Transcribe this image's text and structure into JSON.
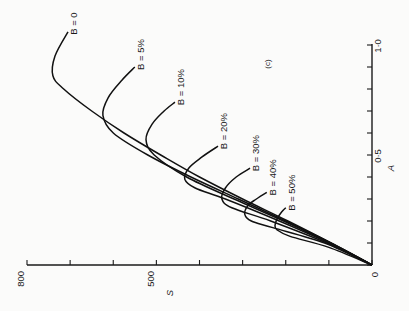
{
  "chart_data": {
    "type": "line",
    "title": "",
    "panel_label": "(c)",
    "orientation": "rotated 90° counter-clockwise (S axis runs horizontally along bottom, decreasing to the right; A axis vertical on right)",
    "xlabel": "A",
    "ylabel": "S",
    "xlim": [
      0,
      1.0
    ],
    "ylim": [
      0,
      800
    ],
    "x_ticks": [
      0,
      0.1,
      0.2,
      0.3,
      0.4,
      0.5,
      0.6,
      0.7,
      0.8,
      0.9,
      1.0
    ],
    "x_tick_labels": [
      "0",
      "",
      "",
      "",
      "",
      "0·5",
      "",
      "",
      "",
      "",
      "1·0"
    ],
    "y_ticks": [
      0,
      100,
      200,
      300,
      400,
      500,
      600,
      700,
      800
    ],
    "y_tick_labels": [
      "",
      "",
      "",
      "",
      "",
      "500",
      "",
      "",
      "800"
    ],
    "origin_label": "0",
    "grid": false,
    "legend": "inline labels at curve ends",
    "series": [
      {
        "name": "B = 0",
        "label": "B = 0",
        "points": [
          [
            0,
            0
          ],
          [
            0.1,
            95
          ],
          [
            0.2,
            195
          ],
          [
            0.3,
            300
          ],
          [
            0.4,
            400
          ],
          [
            0.5,
            490
          ],
          [
            0.6,
            575
          ],
          [
            0.7,
            650
          ],
          [
            0.8,
            715
          ],
          [
            0.86,
            740
          ],
          [
            0.95,
            735
          ],
          [
            1.06,
            705
          ]
        ]
      },
      {
        "name": "B = 5%",
        "label": "B = 5%",
        "points": [
          [
            0,
            0
          ],
          [
            0.1,
            95
          ],
          [
            0.2,
            200
          ],
          [
            0.3,
            310
          ],
          [
            0.4,
            420
          ],
          [
            0.5,
            520
          ],
          [
            0.6,
            600
          ],
          [
            0.68,
            624
          ],
          [
            0.76,
            612
          ],
          [
            0.84,
            580
          ],
          [
            0.9,
            550
          ]
        ]
      },
      {
        "name": "B = 10%",
        "label": "B = 10%",
        "points": [
          [
            0,
            0
          ],
          [
            0.1,
            97
          ],
          [
            0.2,
            205
          ],
          [
            0.3,
            320
          ],
          [
            0.4,
            430
          ],
          [
            0.5,
            505
          ],
          [
            0.57,
            524
          ],
          [
            0.64,
            510
          ],
          [
            0.7,
            482
          ],
          [
            0.74,
            457
          ]
        ]
      },
      {
        "name": "B = 20%",
        "label": "B = 20%",
        "points": [
          [
            0,
            0
          ],
          [
            0.1,
            100
          ],
          [
            0.2,
            215
          ],
          [
            0.3,
            340
          ],
          [
            0.35,
            410
          ],
          [
            0.39,
            434
          ],
          [
            0.44,
            425
          ],
          [
            0.49,
            395
          ],
          [
            0.54,
            357
          ]
        ]
      },
      {
        "name": "B = 30%",
        "label": "B = 30%",
        "points": [
          [
            0,
            0
          ],
          [
            0.1,
            105
          ],
          [
            0.2,
            235
          ],
          [
            0.26,
            325
          ],
          [
            0.3,
            348
          ],
          [
            0.35,
            340
          ],
          [
            0.4,
            315
          ],
          [
            0.44,
            283
          ]
        ]
      },
      {
        "name": "B = 40%",
        "label": "B = 40%",
        "points": [
          [
            0,
            0
          ],
          [
            0.1,
            110
          ],
          [
            0.17,
            230
          ],
          [
            0.2,
            280
          ],
          [
            0.23,
            295
          ],
          [
            0.27,
            288
          ],
          [
            0.3,
            268
          ],
          [
            0.33,
            244
          ]
        ]
      },
      {
        "name": "B = 50%",
        "label": "B = 50%",
        "points": [
          [
            0,
            0
          ],
          [
            0.08,
            100
          ],
          [
            0.13,
            190
          ],
          [
            0.16,
            220
          ],
          [
            0.18,
            225
          ],
          [
            0.21,
            220
          ],
          [
            0.24,
            210
          ],
          [
            0.26,
            200
          ]
        ]
      }
    ]
  }
}
